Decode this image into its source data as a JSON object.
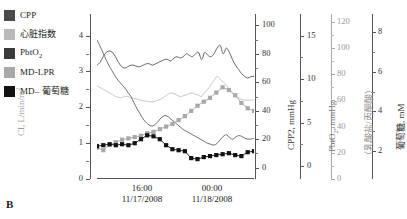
{
  "panel_label": "B",
  "legend": {
    "items": [
      {
        "label": "CPP",
        "color": "#4a4a4a",
        "name": "legend-cpp"
      },
      {
        "label": "心脏指数",
        "color": "#b9b9b9",
        "name": "legend-cardiac-index"
      },
      {
        "label": "PbtO",
        "sub": "2",
        "color": "#3a3a3a",
        "name": "legend-pbto2"
      },
      {
        "label": "MD-LPR",
        "color": "#a8a8a8",
        "name": "legend-md-lpr"
      },
      {
        "label": "MD– 葡萄糖",
        "color": "#111111",
        "name": "legend-md-glucose"
      }
    ]
  },
  "chart_data": {
    "type": "line",
    "title": "",
    "xlabel": "",
    "grid": false,
    "legend_position": "left-outside",
    "x_axis": {
      "ticks": [
        "16:00",
        "00:00"
      ],
      "tick_sublabels": [
        "11/17/2008",
        "11/18/2008"
      ],
      "minor_ticks": 4
    },
    "axes": [
      {
        "id": "ci",
        "label": "CI, L/min/m",
        "sup": "2",
        "unit": "L/min/m2",
        "ticks": [
          0,
          1,
          2,
          3,
          4
        ],
        "lim": [
          0,
          4.6
        ],
        "side": "left",
        "color": "#b9b9b9"
      },
      {
        "id": "cpp",
        "label": "CPP2, mmHg",
        "unit": "mmHg",
        "ticks": [
          0,
          20,
          40,
          60,
          80,
          100
        ],
        "lim": [
          -8,
          108
        ],
        "side": "right",
        "color": "#4a4a4a"
      },
      {
        "id": "pbto2",
        "label": "PbtO2, mmHg",
        "unit": "mmHg",
        "ticks": [
          0,
          5,
          10,
          15
        ],
        "lim": [
          -1.5,
          17.5
        ],
        "side": "right",
        "color": "#3a3a3a"
      },
      {
        "id": "lpr",
        "label": "(乳酸盐/丙酮酸)",
        "unit": "ratio",
        "ticks": [
          0,
          20,
          40,
          60,
          80,
          100,
          120
        ],
        "lim": [
          0,
          126
        ],
        "side": "right",
        "color": "#a8a8a8"
      },
      {
        "id": "glucose",
        "label": "葡萄糖, mM",
        "unit": "mM",
        "ticks": [
          2,
          4,
          6,
          8
        ],
        "lim": [
          0.6,
          8.9
        ],
        "side": "right",
        "color": "#111111"
      }
    ],
    "series": [
      {
        "name": "CPP",
        "axis": "cpp",
        "color": "#4a4a4a",
        "marker": "none",
        "values": [
          72,
          74,
          78,
          81,
          82,
          81,
          78,
          74,
          71,
          70,
          71,
          72,
          72,
          71,
          71,
          72,
          73,
          73,
          72,
          73,
          74,
          75,
          76,
          76,
          75,
          77,
          78,
          77,
          78,
          80,
          79,
          78,
          80,
          81,
          76,
          81,
          79,
          78,
          80,
          84,
          86,
          80,
          84,
          81,
          76,
          72,
          69,
          66,
          64,
          63,
          64,
          64
        ]
      },
      {
        "name": "心脏指数",
        "axis": "ci",
        "color": "#bdbdbd",
        "marker": "none",
        "values": [
          2.6,
          2.55,
          2.5,
          2.45,
          2.4,
          2.36,
          2.3,
          2.28,
          2.27,
          2.3,
          2.3,
          2.26,
          2.25,
          2.23,
          2.2,
          2.18,
          2.17,
          2.16,
          2.15,
          2.17,
          2.2,
          2.24,
          2.3,
          2.36,
          2.4,
          2.38,
          2.34,
          2.3,
          2.32,
          2.35,
          2.38,
          2.4,
          2.36,
          2.34,
          2.3,
          2.42,
          2.5,
          2.62,
          2.75,
          2.86,
          2.78,
          2.7,
          2.62,
          2.5,
          2.4,
          2.32,
          2.26,
          2.22,
          2.2,
          2.2,
          2.2,
          2.2
        ]
      },
      {
        "name": "PbtO2",
        "axis": "pbto2",
        "color": "#555555",
        "marker": "none",
        "values": [
          14.5,
          13.8,
          13.0,
          12.2,
          11.5,
          10.9,
          10.3,
          9.8,
          9.4,
          9.0,
          8.5,
          8.0,
          7.3,
          6.6,
          6.0,
          5.4,
          5.0,
          4.7,
          4.6,
          4.8,
          5.2,
          5.6,
          5.8,
          5.7,
          5.4,
          5.1,
          4.8,
          4.5,
          4.2,
          4.0,
          3.8,
          3.6,
          3.4,
          3.2,
          3.0,
          2.8,
          2.6,
          2.5,
          2.4,
          2.6,
          3.0,
          3.4,
          3.6,
          3.3,
          3.1,
          3.3,
          3.5,
          3.4,
          3.2,
          3.1,
          3.1,
          3.2
        ]
      },
      {
        "name": "MD-LPR",
        "axis": "lpr",
        "color": "#a8a8a8",
        "marker": "square",
        "values": [
          24,
          22,
          26,
          28,
          30,
          31,
          32,
          33,
          35,
          36,
          38,
          40,
          42,
          45,
          48,
          52,
          56,
          59,
          62,
          66,
          70,
          68,
          64,
          58,
          54,
          52
        ]
      },
      {
        "name": "MD–葡萄糖",
        "axis": "glucose",
        "color": "#111111",
        "marker": "square",
        "values": [
          2.25,
          2.3,
          2.35,
          2.3,
          2.35,
          2.3,
          2.4,
          2.6,
          2.8,
          2.75,
          2.6,
          2.3,
          2.1,
          2.05,
          2.0,
          1.65,
          1.6,
          1.7,
          1.75,
          1.8,
          1.85,
          1.9,
          1.8,
          1.75,
          1.95,
          2.0
        ]
      }
    ]
  }
}
